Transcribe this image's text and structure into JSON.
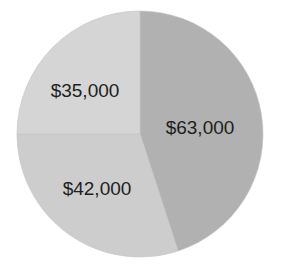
{
  "chart_data": {
    "type": "pie",
    "title": "",
    "start_angle": "12 o'clock",
    "direction": "clockwise",
    "slices": [
      {
        "label": "$63,000",
        "value": 63000,
        "color": "#b1b1b1",
        "label_pos": [
          200,
          127
        ]
      },
      {
        "label": "$42,000",
        "value": 42000,
        "color": "#cdcdcd",
        "label_pos": [
          97,
          188
        ]
      },
      {
        "label": "$35,000",
        "value": 35000,
        "color": "#d5d5d5",
        "label_pos": [
          85,
          90
        ]
      }
    ],
    "legend": "none",
    "center": [
      140,
      134
    ],
    "radius": 123
  }
}
